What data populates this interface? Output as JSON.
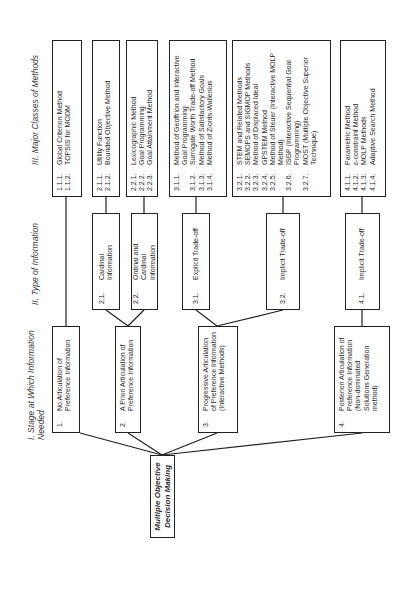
{
  "headers": {
    "stage": {
      "roman": "I.",
      "label": "Stage at Which Information Needed"
    },
    "type": {
      "roman": "II.",
      "label": "Type of Information"
    },
    "methods": {
      "roman": "III.",
      "label": "Major Classes of Methods"
    }
  },
  "root": {
    "label": "Multiple Objective Decision Making"
  },
  "stages": [
    {
      "num": "1.",
      "label": "No  Articulation of Preference Information"
    },
    {
      "num": "2.",
      "label": "A Priori Articulation of Preference Information"
    },
    {
      "num": "3.",
      "label": "Progressive Articulation of Preference Information (Interactive Methods)"
    },
    {
      "num": "4.",
      "label": "Posteriori Articulation of Preference Information (Non-dominated Solutions Generation method)"
    }
  ],
  "types": [
    {
      "num": "2.1.",
      "label": "Cardinal Information"
    },
    {
      "num": "2.2.",
      "label": "Ordinal and Cardinal Information"
    },
    {
      "num": "3.1.",
      "label": "Explicit Trade-off"
    },
    {
      "num": "3.2.",
      "label": "Implicit Trade-off"
    },
    {
      "num": "4.1.",
      "label": "Implicit Trade-off"
    }
  ],
  "method_groups": [
    {
      "items": [
        {
          "num": "1.1.1.",
          "label": "Global Criterion  Method"
        },
        {
          "num": "1.1.2.",
          "label": "TOPSIS for MODM"
        }
      ]
    },
    {
      "items": [
        {
          "num": "2.1.1.",
          "label": "Utility Function"
        },
        {
          "num": "2.1.2.",
          "label": "Bounded Objective Method"
        }
      ]
    },
    {
      "items": [
        {
          "num": "2.2.1.",
          "label": "Lexicographic Method"
        },
        {
          "num": "2.2.2.",
          "label": "Goal Programming"
        },
        {
          "num": "2.2.3.",
          "label": "Goal Attainment Method"
        }
      ]
    },
    {
      "items": [
        {
          "num": "3.1.1.",
          "label": "Method of Geoffrion and Interactive Goal Programming"
        },
        {
          "num": "3.1.2.",
          "label": "Surrogate Worth Trade-off Method"
        },
        {
          "num": "3.1.3.",
          "label": "Method of Satisfactory Goals"
        },
        {
          "num": "3.1.4.",
          "label": "Method of Zionts-Wallenius"
        }
      ]
    },
    {
      "items": [
        {
          "num": "3.2.1.",
          "label": "STEM and Related Methods"
        },
        {
          "num": "3.2.2.",
          "label": "SEMOPS and SIGMOP Methods"
        },
        {
          "num": "3.2.3.",
          "label": "Method of Displaced Ideal"
        },
        {
          "num": "3.2.4.",
          "label": "GPSTEM Method"
        },
        {
          "num": "3.2.5.",
          "label": "Method of Steuer (Interactive MOLP Method)"
        },
        {
          "num": "3.2.6.",
          "label": "ISGP (Interactive Sequential Goal Programming)"
        },
        {
          "num": "3.2.7.",
          "label": "MOST (Multiple Objective Superior Technique)"
        }
      ]
    },
    {
      "items": [
        {
          "num": "4.1.1.",
          "label": "Parametric Method"
        },
        {
          "num": "4.1.2.",
          "label": "ε-constraint Method"
        },
        {
          "num": "4.1.3.",
          "label": "MOLP Methods"
        },
        {
          "num": "4.1.4.",
          "label": "Adaptive  Search Method"
        }
      ]
    }
  ]
}
